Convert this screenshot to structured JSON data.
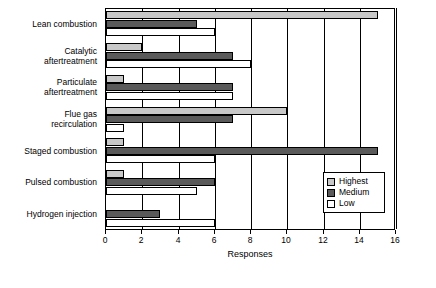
{
  "chart_data": {
    "type": "bar",
    "orientation": "horizontal",
    "title": "",
    "xlabel": "Responses",
    "ylabel": "",
    "xlim": [
      0,
      16
    ],
    "xticks": [
      0,
      2,
      4,
      6,
      8,
      10,
      12,
      14,
      16
    ],
    "grid": true,
    "grid_axis": "x",
    "legend": [
      "Highest",
      "Medium",
      "Low"
    ],
    "legend_position": "bottom-right inside plot",
    "categories": [
      "Lean combustion",
      "Catalytic\naftertreatment",
      "Particulate\naftertreatment",
      "Flue gas\nrecirculation",
      "Staged combustion",
      "Pulsed combustion",
      "Hydrogen injection"
    ],
    "series": [
      {
        "name": "Highest",
        "color": "#c8c8c8",
        "values": [
          15,
          2,
          1,
          10,
          1,
          1,
          0
        ]
      },
      {
        "name": "Medium",
        "color": "#5a5a5a",
        "values": [
          5,
          7,
          7,
          7,
          15,
          6,
          3
        ]
      },
      {
        "name": "Low",
        "color": "#ffffff",
        "values": [
          6,
          8,
          7,
          1,
          6,
          5,
          6
        ]
      }
    ]
  },
  "legend": {
    "items": [
      {
        "label": "Highest",
        "key": "highest"
      },
      {
        "label": "Medium",
        "key": "medium"
      },
      {
        "label": "Low",
        "key": "low"
      }
    ]
  },
  "axis": {
    "x_title": "Responses",
    "ticks": [
      "0",
      "2",
      "4",
      "6",
      "8",
      "10",
      "12",
      "14",
      "16"
    ]
  },
  "categories": [
    {
      "label": "Lean combustion"
    },
    {
      "label": "Catalytic\naftertreatment"
    },
    {
      "label": "Particulate\naftertreatment"
    },
    {
      "label": "Flue gas\nrecirculation"
    },
    {
      "label": "Staged combustion"
    },
    {
      "label": "Pulsed combustion"
    },
    {
      "label": "Hydrogen injection"
    }
  ]
}
